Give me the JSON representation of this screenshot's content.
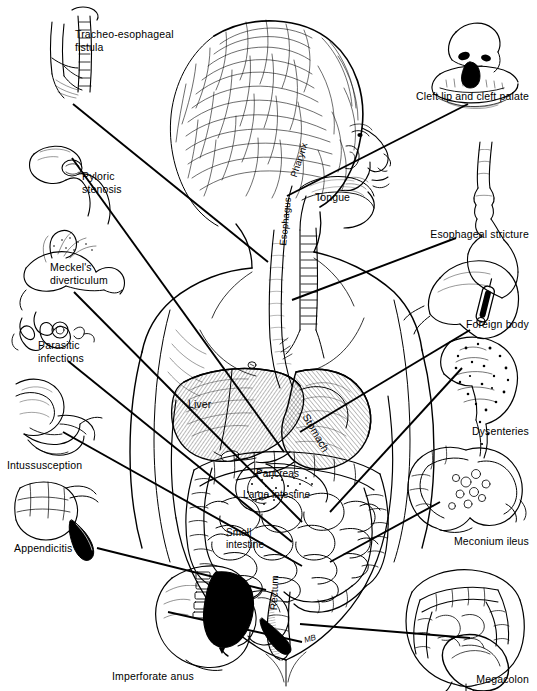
{
  "figure": {
    "signature": "MB",
    "ink_color": "#000000",
    "background_color": "#ffffff",
    "width": 537,
    "height": 691
  },
  "left_conditions": [
    {
      "id": "tracheo-esophageal-fistula",
      "label": "Tracheo-esophageal\nfistula",
      "x": 75,
      "y": 28,
      "anchor": "left"
    },
    {
      "id": "pyloric-stenosis",
      "label": "Pyloric\nstenosis",
      "x": 82,
      "y": 170,
      "anchor": "left"
    },
    {
      "id": "meckels-diverticulum",
      "label": "Meckel's\ndiverticulum",
      "x": 50,
      "y": 261,
      "anchor": "left"
    },
    {
      "id": "parasitic-infections",
      "label": "Parasitic\ninfections",
      "x": 38,
      "y": 339,
      "anchor": "left"
    },
    {
      "id": "intussusception",
      "label": "Intussusception",
      "x": 7,
      "y": 459,
      "anchor": "left"
    },
    {
      "id": "appendicitis",
      "label": "Appendicitis",
      "x": 14,
      "y": 542,
      "anchor": "left"
    },
    {
      "id": "imperforate-anus",
      "label": "Imperforate anus",
      "x": 112,
      "y": 670,
      "anchor": "left"
    }
  ],
  "right_conditions": [
    {
      "id": "cleft-lip-and-cleft-palate",
      "label": "Cleft lip and cleft palate",
      "x": 529,
      "y": 90,
      "anchor": "right"
    },
    {
      "id": "esophageal-stricture",
      "label": "Esophageal stricture",
      "x": 529,
      "y": 228,
      "anchor": "right"
    },
    {
      "id": "foreign-body",
      "label": "Foreign body",
      "x": 529,
      "y": 318,
      "anchor": "right"
    },
    {
      "id": "dysenteries",
      "label": "Dysenteries",
      "x": 529,
      "y": 425,
      "anchor": "right"
    },
    {
      "id": "meconium-ileus",
      "label": "Meconium ileus",
      "x": 529,
      "y": 535,
      "anchor": "right"
    },
    {
      "id": "megacolon",
      "label": "Megacolon",
      "x": 529,
      "y": 673,
      "anchor": "right"
    }
  ],
  "organ_labels": [
    {
      "id": "pharynx",
      "label": "Pharynx",
      "x": 288,
      "y": 175,
      "rotation": -72
    },
    {
      "id": "tongue",
      "label": "Tongue",
      "x": 315,
      "y": 197,
      "rotation": 0
    },
    {
      "id": "esophagus",
      "label": "Esophagus",
      "x": 277,
      "y": 245,
      "rotation": -84
    },
    {
      "id": "liver",
      "label": "Liver",
      "x": 188,
      "y": 404,
      "rotation": 0
    },
    {
      "id": "stomach",
      "label": "Stomach",
      "x": 310,
      "y": 412,
      "rotation": 60
    },
    {
      "id": "pancreas",
      "label": "Pancreas",
      "x": 256,
      "y": 473,
      "rotation": 0
    },
    {
      "id": "large-intestine",
      "label": "Large intestine",
      "x": 243,
      "y": 494,
      "rotation": 0
    },
    {
      "id": "small-intestine",
      "label": "Small\nintestine",
      "x": 236,
      "y": 532,
      "rotation": 0
    },
    {
      "id": "rectum",
      "label": "Rectum",
      "x": 268,
      "y": 610,
      "rotation": -88
    }
  ],
  "leader_lines": [
    {
      "id": "leader-tracheo-esophageal-fistula",
      "from": [
        73,
        104
      ],
      "to": [
        268,
        262
      ]
    },
    {
      "id": "leader-pyloric-stenosis",
      "from": [
        72,
        158
      ],
      "to": [
        282,
        448
      ]
    },
    {
      "id": "leader-meckels-diverticulum",
      "from": [
        74,
        292
      ],
      "to": [
        300,
        520
      ]
    },
    {
      "id": "leader-parasitic-infections",
      "from": [
        68,
        361
      ],
      "to": [
        290,
        540
      ]
    },
    {
      "id": "leader-intussusception",
      "from": [
        63,
        432
      ],
      "to": [
        300,
        565
      ]
    },
    {
      "id": "leader-appendicitis",
      "from": [
        97,
        548
      ],
      "to": [
        268,
        590
      ]
    },
    {
      "id": "leader-imperforate-anus",
      "from": [
        168,
        612
      ],
      "to": [
        300,
        640
      ]
    },
    {
      "id": "leader-cleft-lip",
      "from": [
        468,
        104
      ],
      "to": [
        287,
        196
      ]
    },
    {
      "id": "leader-esophageal-stricture",
      "from": [
        455,
        238
      ],
      "to": [
        292,
        300
      ]
    },
    {
      "id": "leader-foreign-body",
      "from": [
        470,
        330
      ],
      "to": [
        300,
        430
      ]
    },
    {
      "id": "leader-dysenteries",
      "from": [
        460,
        368
      ],
      "to": [
        330,
        510
      ]
    },
    {
      "id": "leader-meconium-ileus",
      "from": [
        440,
        500
      ],
      "to": [
        330,
        560
      ]
    },
    {
      "id": "leader-megacolon",
      "from": [
        470,
        636
      ],
      "to": [
        300,
        622
      ]
    }
  ]
}
